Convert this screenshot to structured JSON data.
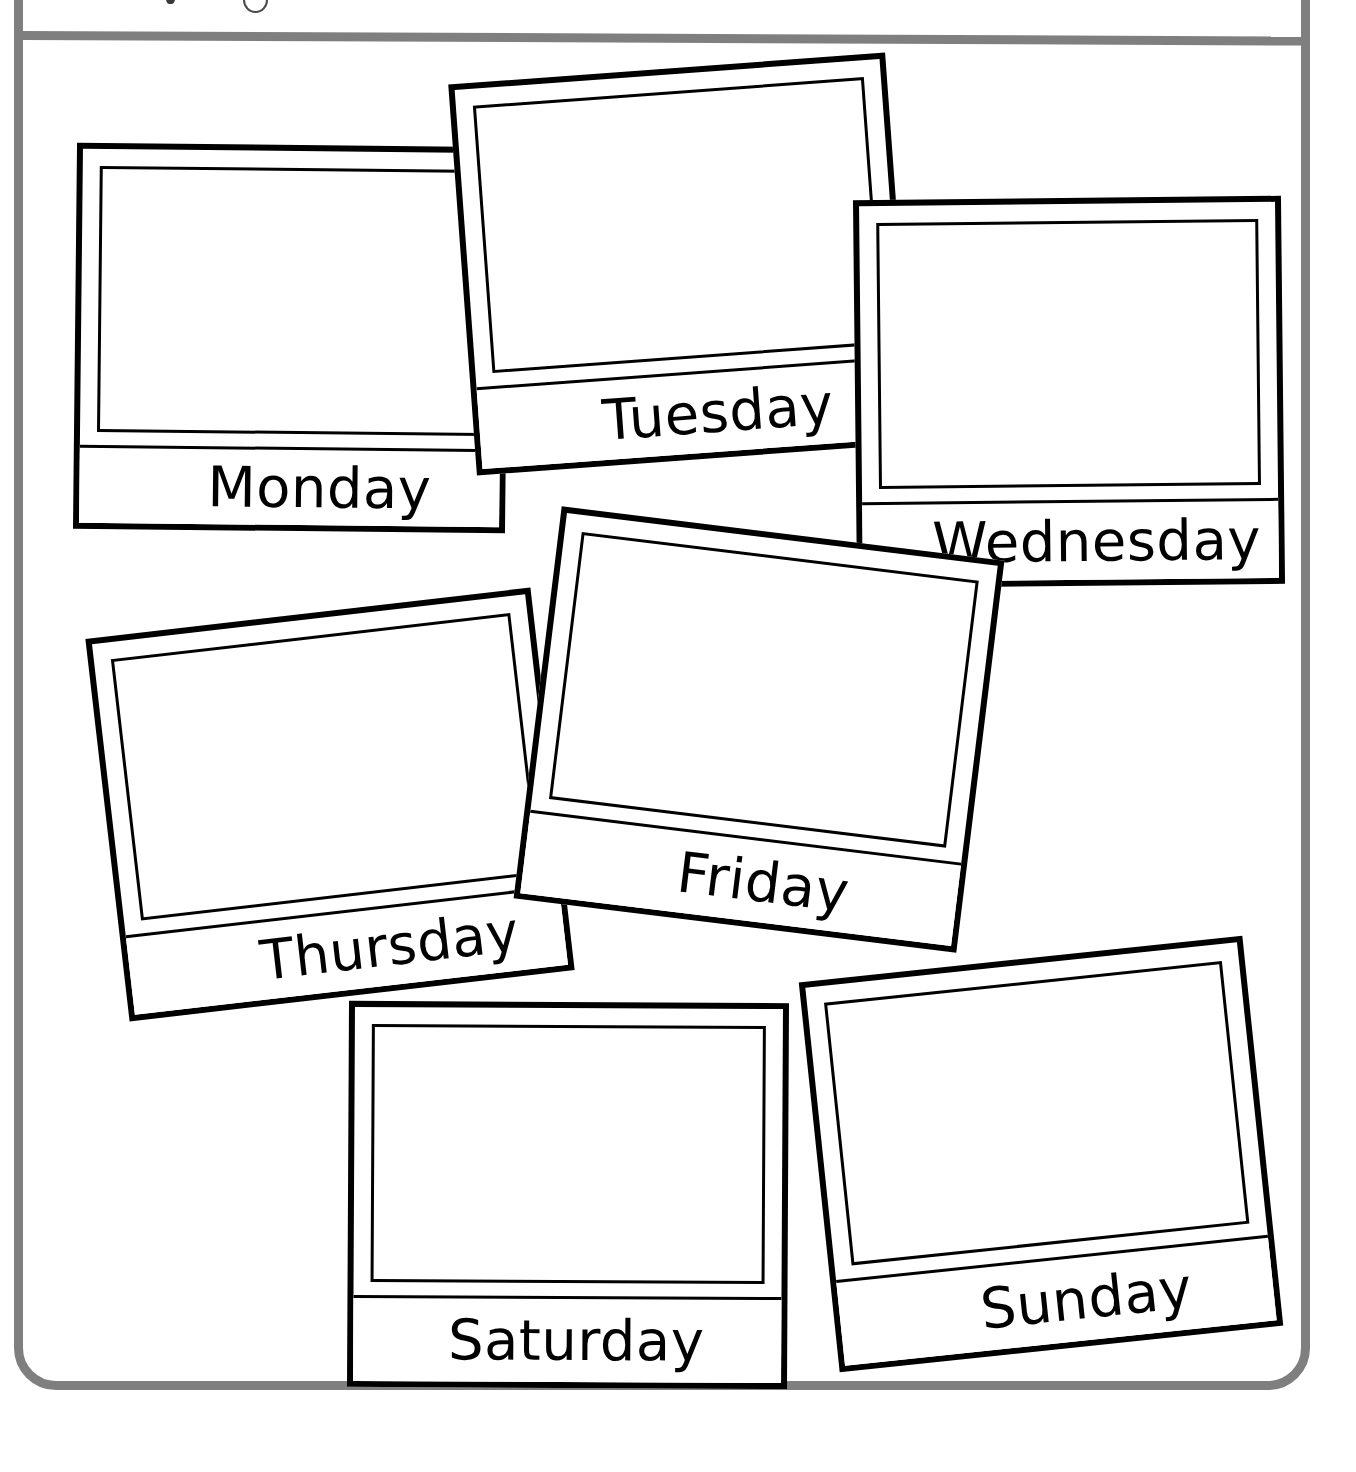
{
  "page": {
    "background_color": "#ffffff",
    "width": 1356,
    "height": 1472
  },
  "worksheet_frame": {
    "color": "#7f7f80",
    "border_width_px": 9,
    "corner_radius_px": 42,
    "has_top_divider_rule": true,
    "header_text_clipped": true
  },
  "card_style": {
    "outer_border_color": "#000000",
    "inner_photo_border_color": "#000000",
    "fill_color": "#ffffff",
    "photo_area_empty": true
  },
  "cards": [
    {
      "id": "monday",
      "label": "Monday",
      "rotation_deg": 0.6,
      "photo_content": ""
    },
    {
      "id": "tuesday",
      "label": "Tuesday",
      "rotation_deg": -4.2,
      "photo_content": ""
    },
    {
      "id": "wednesday",
      "label": "Wednesday",
      "rotation_deg": -0.6,
      "photo_content": ""
    },
    {
      "id": "thursday",
      "label": "Thursday",
      "rotation_deg": -6.6,
      "photo_content": ""
    },
    {
      "id": "friday",
      "label": "Friday",
      "rotation_deg": 7.0,
      "photo_content": ""
    },
    {
      "id": "saturday",
      "label": "Saturday",
      "rotation_deg": 0.3,
      "photo_content": ""
    },
    {
      "id": "sunday",
      "label": "Sunday",
      "rotation_deg": -6.0,
      "photo_content": ""
    }
  ]
}
